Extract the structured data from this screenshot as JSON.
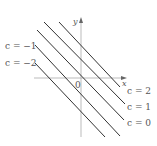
{
  "diagram": {
    "axes": {
      "x_label": "x",
      "y_label": "y",
      "origin_label": "0"
    },
    "lines": [
      {
        "c": 2,
        "label": "c = 2",
        "x1": 59,
        "y1": 22,
        "x2": 120,
        "y2": 87
      },
      {
        "c": 1,
        "label": "c = 1",
        "x1": 44,
        "y1": 22,
        "x2": 125,
        "y2": 104
      },
      {
        "c": 0,
        "label": "c = 0",
        "x1": 37,
        "y1": 30,
        "x2": 124,
        "y2": 120
      },
      {
        "c": -1,
        "label": "c = −1",
        "x1": 35,
        "y1": 45,
        "x2": 120,
        "y2": 136
      },
      {
        "c": -2,
        "label": "c = −2",
        "x1": 35,
        "y1": 63,
        "x2": 105,
        "y2": 137
      }
    ],
    "colors": {
      "line": "#333333",
      "axis": "#aaaaaa",
      "text": "#555555"
    }
  }
}
